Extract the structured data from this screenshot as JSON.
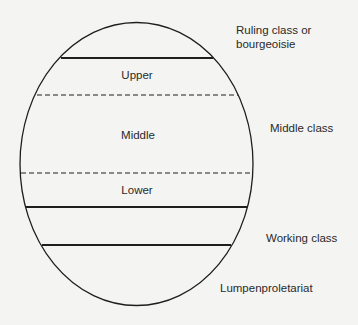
{
  "diagram": {
    "type": "class-structure-ellipse",
    "inner_labels": {
      "upper": "Upper",
      "middle": "Middle",
      "lower": "Lower"
    },
    "outer_labels": {
      "ruling_line1": "Ruling class or",
      "ruling_line2": "bourgeoisie",
      "middle_class": "Middle class",
      "working_class": "Working class",
      "lumpen": "Lumpenproletariat"
    },
    "colors": {
      "stroke": "#1e1e1e",
      "background": "#f4f4f2"
    }
  }
}
